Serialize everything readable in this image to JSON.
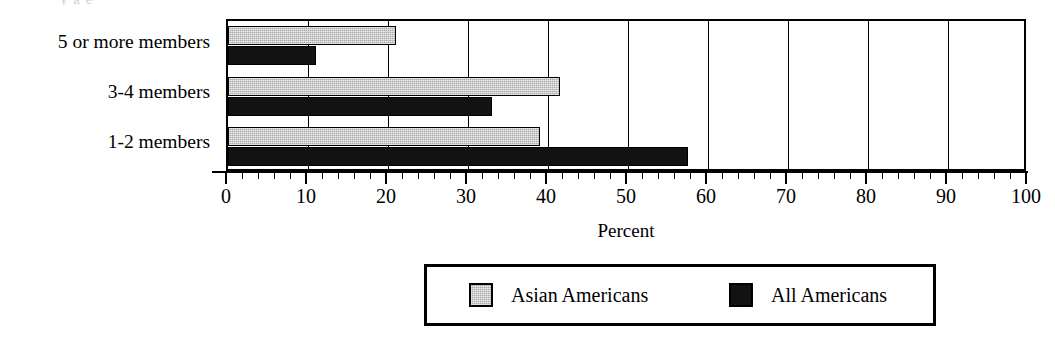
{
  "clipped_title": "y  a  e",
  "chart_data": {
    "type": "bar",
    "orientation": "horizontal",
    "title": "",
    "xlabel": "Percent",
    "ylabel": "",
    "categories": [
      "1-2 members",
      "3-4 members",
      "5 or more members"
    ],
    "categories_top_to_bottom": [
      "5 or more members",
      "3-4 members",
      "1-2 members"
    ],
    "series": [
      {
        "name": "Asian Americans",
        "color": "#a9a9a9",
        "values": [
          39,
          41.5,
          21
        ]
      },
      {
        "name": "All Americans",
        "color": "#121212",
        "values": [
          57.5,
          33,
          11
        ]
      }
    ],
    "xlim": [
      0,
      100
    ],
    "xticks": [
      0,
      10,
      20,
      30,
      40,
      50,
      60,
      70,
      80,
      90,
      100
    ],
    "xtick_labels": [
      "0",
      "10",
      "20",
      "30",
      "40",
      "50",
      "60",
      "70",
      "80",
      "90",
      "100"
    ],
    "minor_tick_step": 2,
    "grid": true,
    "grid_axis": "x",
    "legend_position": "bottom"
  }
}
